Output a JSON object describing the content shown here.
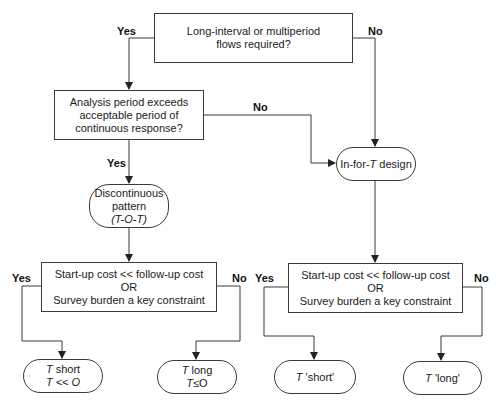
{
  "decisions": {
    "d1": {
      "lines": [
        "Long-interval or multiperiod",
        "flows required?"
      ]
    },
    "d2": {
      "lines": [
        "Analysis period exceeds",
        "acceptable period of",
        "continuous response?"
      ]
    },
    "d3_left": {
      "lines": [
        "Start-up cost << follow-up cost",
        "OR",
        "Survey burden a key constraint"
      ]
    },
    "d3_right": {
      "lines": [
        "Start-up cost << follow-up cost",
        "OR",
        "Survey burden a key constraint"
      ]
    }
  },
  "processes": {
    "discontinuous": {
      "line1": "Discontinuous",
      "line2": "pattern",
      "line3": "(T-O-T)"
    },
    "in_for_t": {
      "pre": "In-for-",
      "italic": "T",
      "post": " design"
    }
  },
  "terminals": {
    "t_short": {
      "it1": "T",
      "txt1": " short",
      "it2": "T << O"
    },
    "t_long": {
      "it1": "T",
      "txt1": " long",
      "it2": "T",
      "txt2": "≤O"
    },
    "t_short_q": {
      "it": "T",
      "txt": " 'short'"
    },
    "t_long_q": {
      "it": "T",
      "txt": " 'long'"
    }
  },
  "branch_labels": {
    "yes": "Yes",
    "no": "No"
  },
  "colors": {
    "line": "#3a3a3a",
    "text": "#1a1a1a"
  }
}
